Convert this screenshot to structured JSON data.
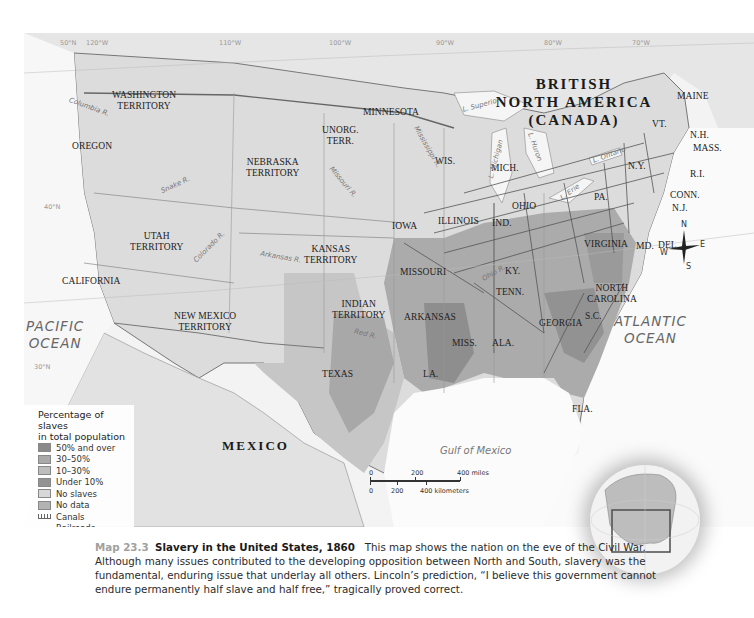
{
  "map": {
    "title_regions": {
      "canada": [
        "BRITISH",
        "NORTH AMERICA",
        "(CANADA)"
      ],
      "mexico": "MEXICO"
    },
    "oceans": {
      "pacific": [
        "PACIFIC",
        "OCEAN"
      ],
      "atlantic": [
        "ATLANTIC",
        "OCEAN"
      ],
      "gulf": "Gulf of Mexico"
    },
    "grid_labels": {
      "top": [
        "50°N",
        "120°W",
        "110°W",
        "100°W",
        "90°W",
        "80°W",
        "70°W"
      ],
      "left": [
        "40°N",
        "30°N"
      ]
    },
    "territories": [
      {
        "id": "washington",
        "lines": [
          "WASHINGTON",
          "TERRITORY"
        ]
      },
      {
        "id": "oregon",
        "lines": [
          "OREGON"
        ]
      },
      {
        "id": "nebraska",
        "lines": [
          "NEBRASKA",
          "TERRITORY"
        ]
      },
      {
        "id": "unorg",
        "lines": [
          "UNORG.",
          "TERR."
        ]
      },
      {
        "id": "minnesota",
        "lines": [
          "MINNESOTA"
        ]
      },
      {
        "id": "utah",
        "lines": [
          "UTAH",
          "TERRITORY"
        ]
      },
      {
        "id": "california",
        "lines": [
          "CALIFORNIA"
        ]
      },
      {
        "id": "kansas",
        "lines": [
          "KANSAS",
          "TERRITORY"
        ]
      },
      {
        "id": "new-mexico",
        "lines": [
          "NEW MEXICO",
          "TERRITORY"
        ]
      },
      {
        "id": "indian",
        "lines": [
          "INDIAN",
          "TERRITORY"
        ]
      },
      {
        "id": "texas",
        "lines": [
          "TEXAS"
        ]
      },
      {
        "id": "iowa",
        "lines": [
          "IOWA"
        ]
      },
      {
        "id": "wis",
        "lines": [
          "WIS."
        ]
      },
      {
        "id": "mich",
        "lines": [
          "MICH."
        ]
      },
      {
        "id": "illinois",
        "lines": [
          "ILLINOIS"
        ]
      },
      {
        "id": "ind",
        "lines": [
          "IND."
        ]
      },
      {
        "id": "ohio",
        "lines": [
          "OHIO"
        ]
      },
      {
        "id": "missouri",
        "lines": [
          "MISSOURI"
        ]
      },
      {
        "id": "ky",
        "lines": [
          "KY."
        ]
      },
      {
        "id": "tenn",
        "lines": [
          "TENN."
        ]
      },
      {
        "id": "arkansas",
        "lines": [
          "ARKANSAS"
        ]
      },
      {
        "id": "miss",
        "lines": [
          "MISS."
        ]
      },
      {
        "id": "ala",
        "lines": [
          "ALA."
        ]
      },
      {
        "id": "georgia",
        "lines": [
          "GEORGIA"
        ]
      },
      {
        "id": "sc",
        "lines": [
          "S.C."
        ]
      },
      {
        "id": "nc",
        "lines": [
          "NORTH",
          "CAROLINA"
        ]
      },
      {
        "id": "virginia",
        "lines": [
          "VIRGINIA"
        ]
      },
      {
        "id": "la",
        "lines": [
          "LA."
        ]
      },
      {
        "id": "fla",
        "lines": [
          "FLA."
        ]
      },
      {
        "id": "pa",
        "lines": [
          "PA."
        ]
      },
      {
        "id": "ny",
        "lines": [
          "N.Y."
        ]
      },
      {
        "id": "maine",
        "lines": [
          "MAINE"
        ]
      },
      {
        "id": "vt",
        "lines": [
          "VT."
        ]
      },
      {
        "id": "nh",
        "lines": [
          "N.H."
        ]
      },
      {
        "id": "mass",
        "lines": [
          "MASS."
        ]
      },
      {
        "id": "ri",
        "lines": [
          "R.I."
        ]
      },
      {
        "id": "conn",
        "lines": [
          "CONN."
        ]
      },
      {
        "id": "nj",
        "lines": [
          "N.J."
        ]
      },
      {
        "id": "del",
        "lines": [
          "DEL."
        ]
      },
      {
        "id": "md",
        "lines": [
          "MD."
        ]
      }
    ],
    "rivers_lakes": {
      "columbia": "Columbia R.",
      "snake": "Snake R.",
      "missouri": "Missouri R.",
      "mississippi": "Mississippi R.",
      "colorado": "Colorado R.",
      "arkansas": "Arkansas R.",
      "red": "Red R.",
      "ohio": "Ohio R.",
      "superior": "L. Superior",
      "michigan": "L. Michigan",
      "huron": "L. Huron",
      "erie": "L. Erie",
      "ontario": "L. Ontario"
    },
    "compass": {
      "n": "N",
      "s": "S",
      "e": "E",
      "w": "W"
    },
    "scale": {
      "miles": [
        "0",
        "200",
        "400 miles"
      ],
      "km": [
        "0",
        "200",
        "400 kilometers"
      ]
    }
  },
  "legend": {
    "title": [
      "Percentage of slaves",
      "in total population"
    ],
    "items": [
      {
        "label": "50% and over",
        "color": "#8a8a8a"
      },
      {
        "label": "30–50%",
        "color": "#a9a9a9"
      },
      {
        "label": "10–30%",
        "color": "#bdbdbd"
      },
      {
        "label": "Under 10%",
        "color": "#939393"
      },
      {
        "label": "No slaves",
        "color": "#d8d8d8"
      },
      {
        "label": "No data",
        "color": "#b3b3b3"
      },
      {
        "label": "Canals",
        "symbol": "canal"
      },
      {
        "label": "Railroads",
        "symbol": "railroad"
      }
    ]
  },
  "caption": {
    "number": "Map 23.3",
    "title": "Slavery in the United States, 1860",
    "body": "This map shows the nation on the eve of the Civil War. Although many issues contributed to the developing opposition between North and South, slavery was the fundamental, enduring issue that underlay all others. Lincoln’s prediction, “I believe this government cannot endure permanently half slave and half free,” tragically proved correct."
  }
}
